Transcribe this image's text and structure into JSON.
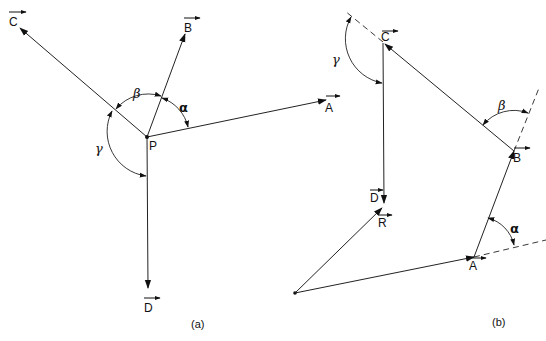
{
  "panel_a": {
    "caption": "(a)",
    "point_label": "P",
    "vectors": {
      "A": "A",
      "B": "B",
      "C": "C",
      "D": "D"
    },
    "angles": {
      "alpha": "α",
      "beta": "β",
      "gamma": "γ"
    }
  },
  "panel_b": {
    "caption": "(b)",
    "vectors": {
      "A": "A",
      "B": "B",
      "C": "C",
      "D": "D",
      "R": "R"
    },
    "angles": {
      "alpha": "α",
      "beta": "β",
      "gamma": "γ"
    }
  },
  "colors": {
    "stroke": "#222222",
    "background": "#ffffff"
  }
}
